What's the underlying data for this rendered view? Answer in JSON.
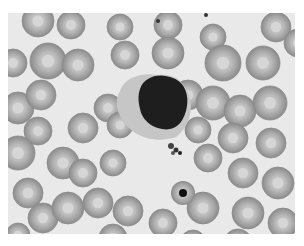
{
  "image": {
    "subject": "blood-smear-micrograph",
    "colors": {
      "background": "#e9e9e9",
      "rbc_fill": "#a9a9a9",
      "rbc_center": "#cfcfcf",
      "nucleus": "#1c1c1c",
      "cytoplasm": "#c4c4c4"
    },
    "rbcs": [
      [
        30,
        8,
        16
      ],
      [
        63,
        12,
        14
      ],
      [
        112,
        14,
        13
      ],
      [
        160,
        12,
        14
      ],
      [
        205,
        24,
        13
      ],
      [
        268,
        14,
        15
      ],
      [
        5,
        50,
        14
      ],
      [
        40,
        48,
        18
      ],
      [
        70,
        52,
        16
      ],
      [
        117,
        42,
        14
      ],
      [
        160,
        40,
        16
      ],
      [
        215,
        50,
        18
      ],
      [
        255,
        50,
        17
      ],
      [
        290,
        30,
        14
      ],
      [
        10,
        95,
        16
      ],
      [
        33,
        82,
        15
      ],
      [
        100,
        95,
        14
      ],
      [
        180,
        82,
        15
      ],
      [
        205,
        90,
        17
      ],
      [
        232,
        98,
        16
      ],
      [
        262,
        90,
        17
      ],
      [
        10,
        140,
        17
      ],
      [
        30,
        118,
        14
      ],
      [
        75,
        115,
        15
      ],
      [
        112,
        112,
        13
      ],
      [
        190,
        117,
        13
      ],
      [
        225,
        125,
        15
      ],
      [
        263,
        130,
        15
      ],
      [
        20,
        180,
        15
      ],
      [
        55,
        150,
        16
      ],
      [
        75,
        160,
        14
      ],
      [
        105,
        150,
        13
      ],
      [
        200,
        145,
        14
      ],
      [
        235,
        160,
        15
      ],
      [
        270,
        170,
        16
      ],
      [
        35,
        205,
        15
      ],
      [
        60,
        195,
        16
      ],
      [
        90,
        190,
        15
      ],
      [
        120,
        198,
        15
      ],
      [
        155,
        210,
        14
      ],
      [
        195,
        195,
        16
      ],
      [
        240,
        200,
        16
      ],
      [
        275,
        210,
        15
      ],
      [
        10,
        222,
        12
      ],
      [
        105,
        225,
        14
      ],
      [
        185,
        230,
        13
      ],
      [
        230,
        230,
        14
      ]
    ],
    "leukocyte": {
      "cx": 152,
      "cy": 87,
      "nucleus_rx": 24,
      "nucleus_ry": 25
    },
    "nucleated_rbc": {
      "cx": 175,
      "cy": 180,
      "r": 12
    }
  }
}
